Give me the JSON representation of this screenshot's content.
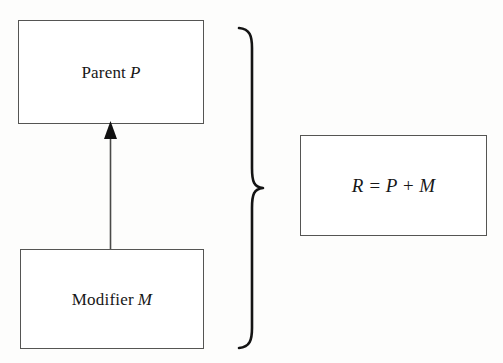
{
  "diagram": {
    "background_color": "#fdfdfc",
    "stroke_color": "#555553",
    "ink_color": "#171717",
    "nodes": {
      "parent": {
        "label_text": "Parent",
        "label_symbol": "P"
      },
      "modifier": {
        "label_text": "Modifier",
        "label_symbol": "M"
      },
      "result": {
        "formula": "R = P + M",
        "formula_parts": {
          "result_symbol": "R",
          "equals": "=",
          "parent_symbol": "P",
          "plus": "+",
          "modifier_symbol": "M"
        }
      }
    },
    "connectors": {
      "inheritance_arrow": {
        "from": "Modifier M",
        "to": "Parent P",
        "direction": "up",
        "head": "solid-triangle",
        "color": "#111111"
      },
      "group_brace": {
        "glyph": "}",
        "orientation": "right",
        "groups": [
          "Parent P",
          "Modifier M"
        ],
        "points_to": "R = P + M",
        "color": "#111111"
      }
    }
  }
}
